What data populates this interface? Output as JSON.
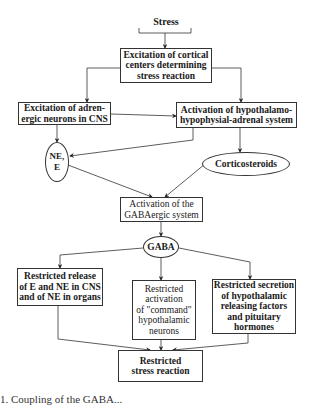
{
  "diagram": {
    "type": "flowchart",
    "nodes": {
      "stress": {
        "label": "Stress",
        "shape": "bracket"
      },
      "cortical": {
        "label": "Excitation of cortical\ncenters determining\nstress reaction",
        "shape": "box"
      },
      "adrenergic": {
        "label": "Excitation of adren-\nergic neurons in CNS",
        "shape": "box"
      },
      "hpa": {
        "label": "Activation of hypothalamo-\nhypophysial-adrenal system",
        "shape": "box"
      },
      "ne_e": {
        "label": "NE,\nE",
        "shape": "ellipse"
      },
      "corticosteroids": {
        "label": "Corticosteroids",
        "shape": "ellipse"
      },
      "gabaergic": {
        "label": "Activation of the\nGABAergic system",
        "shape": "box"
      },
      "gaba": {
        "label": "GABA",
        "shape": "ellipse"
      },
      "restricted_release": {
        "label": "Restricted release\nof E and NE in CNS\nand of NE in organs",
        "shape": "box"
      },
      "restricted_activation": {
        "label": "Restricted\nactivation\nof \"command\"\nhypothalamic\nneurons",
        "shape": "box"
      },
      "restricted_secretion": {
        "label": "Restricted secretion\nof hypothalamic\nreleasing factors\nand pituitary\nhormones",
        "shape": "box"
      },
      "restricted_stress": {
        "label": "Restricted\nstress reaction",
        "shape": "box"
      }
    },
    "edges": [
      {
        "from": "stress",
        "to": "cortical"
      },
      {
        "from": "cortical",
        "to": "adrenergic"
      },
      {
        "from": "cortical",
        "to": "hpa"
      },
      {
        "from": "adrenergic",
        "to": "hpa"
      },
      {
        "from": "adrenergic",
        "to": "ne_e"
      },
      {
        "from": "hpa",
        "to": "ne_e"
      },
      {
        "from": "hpa",
        "to": "corticosteroids"
      },
      {
        "from": "ne_e",
        "to": "gabaergic"
      },
      {
        "from": "corticosteroids",
        "to": "gabaergic"
      },
      {
        "from": "gabaergic",
        "to": "gaba"
      },
      {
        "from": "gaba",
        "to": "restricted_release"
      },
      {
        "from": "gaba",
        "to": "restricted_activation"
      },
      {
        "from": "gaba",
        "to": "restricted_secretion"
      },
      {
        "from": "restricted_release",
        "to": "restricted_stress"
      },
      {
        "from": "restricted_activation",
        "to": "restricted_stress"
      },
      {
        "from": "restricted_secretion",
        "to": "restricted_stress"
      }
    ]
  },
  "caption": "1. Coupling of the GABA..."
}
